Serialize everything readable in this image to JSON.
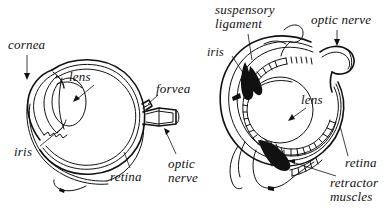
{
  "figure": {
    "background_color": "#ffffff",
    "ink_color": "#111111",
    "title": "",
    "panels": [
      {
        "id": "left-eye",
        "name": "human-eye-cross-section",
        "labels": [
          {
            "key": "cornea",
            "text": "cornea",
            "x": 8,
            "y": 38,
            "pointer": "arrow-down"
          },
          {
            "key": "lens",
            "text": "lens",
            "x": 69,
            "y": 70,
            "pointer": "arrow-down-left"
          },
          {
            "key": "iris",
            "text": "iris",
            "x": 14,
            "y": 145,
            "pointer": "leader-up-right"
          },
          {
            "key": "forvea",
            "text": "forvea",
            "x": 156,
            "y": 82,
            "pointer": "leader-down-left"
          },
          {
            "key": "retina",
            "text": "retina",
            "x": 110,
            "y": 170,
            "pointer": "leader-up-right"
          },
          {
            "key": "optic_nerve",
            "text": "optic\nnerve",
            "x": 168,
            "y": 157,
            "pointer": "arrow-up-left"
          }
        ]
      },
      {
        "id": "right-eye",
        "name": "fish-eye-cross-section",
        "labels": [
          {
            "key": "suspensory_ligament",
            "text": "suspensory\nligament",
            "x": 215,
            "y": 3,
            "pointer": "leader-down-right"
          },
          {
            "key": "optic_nerve",
            "text": "optic nerve",
            "x": 311,
            "y": 13,
            "pointer": "arrow-down"
          },
          {
            "key": "iris",
            "text": "iris",
            "x": 207,
            "y": 46,
            "pointer": "leader-down-right"
          },
          {
            "key": "lens",
            "text": "lens",
            "x": 301,
            "y": 93,
            "pointer": "arrow-down-left"
          },
          {
            "key": "retina",
            "text": "retina",
            "x": 345,
            "y": 156,
            "pointer": "leader-up-left"
          },
          {
            "key": "retractor_muscles",
            "text": "retractor\nmuscles",
            "x": 330,
            "y": 176,
            "pointer": "leader-up-left"
          }
        ]
      }
    ]
  }
}
